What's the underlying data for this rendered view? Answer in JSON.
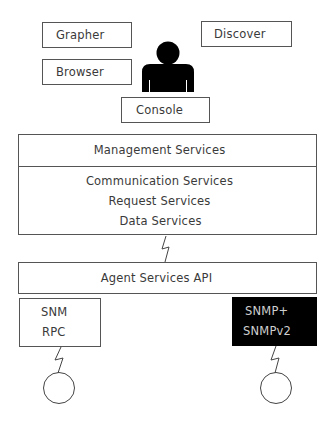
{
  "tools": {
    "grapher": "Grapher",
    "browser": "Browser",
    "discover": "Discover",
    "console": "Console"
  },
  "management": {
    "title": "Management Services",
    "services": [
      "Communication Services",
      "Request Services",
      "Data Services"
    ]
  },
  "agent_api": {
    "label": "Agent Services API"
  },
  "agents": {
    "left": {
      "lines": [
        "SNM",
        "RPC"
      ]
    },
    "right": {
      "lines": [
        "SNMP+",
        "SNMPv2"
      ]
    }
  },
  "colors": {
    "line": "#555555",
    "text": "#3a3a3a",
    "dark_box": "#000000",
    "dark_box_text": "#cfcfcf",
    "person": "#000000"
  }
}
